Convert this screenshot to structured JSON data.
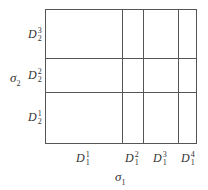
{
  "diagram": {
    "y_axis": {
      "symbol": "σ",
      "sub": "2"
    },
    "x_axis": {
      "symbol": "σ",
      "sub": "1"
    },
    "row_labels": [
      {
        "base": "D",
        "sup": "3",
        "sub": "2"
      },
      {
        "base": "D",
        "sup": "2",
        "sub": "2"
      },
      {
        "base": "D",
        "sup": "1",
        "sub": "2"
      }
    ],
    "col_labels": [
      {
        "base": "D",
        "sup": "1",
        "sub": "1"
      },
      {
        "base": "D",
        "sup": "2",
        "sub": "1"
      },
      {
        "base": "D",
        "sup": "3",
        "sub": "1"
      },
      {
        "base": "D",
        "sup": "4",
        "sub": "1"
      }
    ],
    "line_color": "#555555"
  }
}
